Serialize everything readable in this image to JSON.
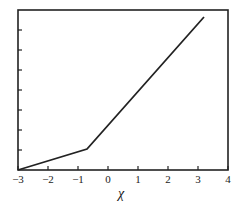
{
  "chart_data": {
    "type": "line",
    "title": "",
    "xlabel": "χ",
    "ylabel": "",
    "xlim": [
      -3,
      4
    ],
    "ylim": [
      0,
      8
    ],
    "grid": false,
    "legend": null,
    "x_ticks": [
      "−3",
      "−2",
      "−1",
      "0",
      "1",
      "2",
      "3",
      "4"
    ],
    "y_ticks_unlabeled_count": 7,
    "series": [
      {
        "name": "piecewise-linear",
        "x": [
          -3,
          -0.7,
          3.2
        ],
        "y": [
          0,
          1.05,
          7.65
        ]
      }
    ]
  }
}
